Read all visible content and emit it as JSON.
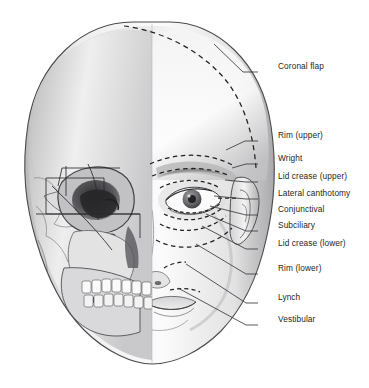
{
  "figure": {
    "kind": "anatomical-illustration",
    "background_color": "#ffffff",
    "line_color": "#231f20",
    "incision_style": "dashed"
  },
  "labels": [
    {
      "id": "coronal-flap",
      "text": "Coronal flap",
      "x": 278,
      "y": 68,
      "dash_x": 258,
      "dash_y": 72,
      "leader": [
        [
          258,
          72
        ],
        [
          243,
          72
        ],
        [
          214,
          44
        ]
      ]
    },
    {
      "id": "rim-upper",
      "text": "Rim (upper)",
      "x": 278,
      "y": 137,
      "dash_x": 258,
      "dash_y": 141,
      "leader": [
        [
          258,
          141
        ],
        [
          245,
          141
        ],
        [
          226,
          150
        ]
      ]
    },
    {
      "id": "wright",
      "text": "Wright",
      "x": 278,
      "y": 160,
      "dash_x": 258,
      "dash_y": 164,
      "leader": [
        [
          258,
          164
        ],
        [
          246,
          164
        ],
        [
          232,
          168
        ]
      ]
    },
    {
      "id": "lid-crease-upper",
      "text": "Lid crease (upper)",
      "x": 278,
      "y": 178,
      "dash_x": 258,
      "dash_y": 182,
      "leader": [
        [
          258,
          182
        ],
        [
          246,
          182
        ],
        [
          225,
          180
        ]
      ]
    },
    {
      "id": "lateral-canthotomy",
      "text": "Lateral canthotomy",
      "x": 278,
      "y": 195,
      "dash_x": 258,
      "dash_y": 199,
      "leader": [
        [
          258,
          199
        ],
        [
          246,
          199
        ],
        [
          214,
          196
        ]
      ]
    },
    {
      "id": "conjunctival",
      "text": "Conjunctival",
      "x": 278,
      "y": 211,
      "dash_x": 258,
      "dash_y": 215,
      "leader": [
        [
          258,
          215
        ],
        [
          246,
          215
        ],
        [
          210,
          206
        ]
      ]
    },
    {
      "id": "subciliary",
      "text": "Subciliary",
      "x": 278,
      "y": 227,
      "dash_x": 258,
      "dash_y": 231,
      "leader": [
        [
          258,
          231
        ],
        [
          246,
          231
        ],
        [
          206,
          214
        ]
      ]
    },
    {
      "id": "lid-crease-lower",
      "text": "Lid crease (lower)",
      "x": 278,
      "y": 245,
      "dash_x": 258,
      "dash_y": 249,
      "leader": [
        [
          258,
          249
        ],
        [
          246,
          249
        ],
        [
          202,
          226
        ]
      ]
    },
    {
      "id": "rim-lower",
      "text": "Rim (lower)",
      "x": 278,
      "y": 270,
      "dash_x": 258,
      "dash_y": 274,
      "leader": [
        [
          258,
          274
        ],
        [
          246,
          274
        ],
        [
          196,
          244
        ]
      ]
    },
    {
      "id": "lynch",
      "text": "Lynch",
      "x": 278,
      "y": 299,
      "dash_x": 258,
      "dash_y": 303,
      "leader": [
        [
          258,
          303
        ],
        [
          246,
          303
        ],
        [
          186,
          264
        ]
      ]
    },
    {
      "id": "vestibular",
      "text": "Vestibular",
      "x": 278,
      "y": 321,
      "dash_x": 258,
      "dash_y": 325,
      "leader": [
        [
          258,
          325
        ],
        [
          246,
          325
        ],
        [
          178,
          288
        ]
      ]
    }
  ]
}
